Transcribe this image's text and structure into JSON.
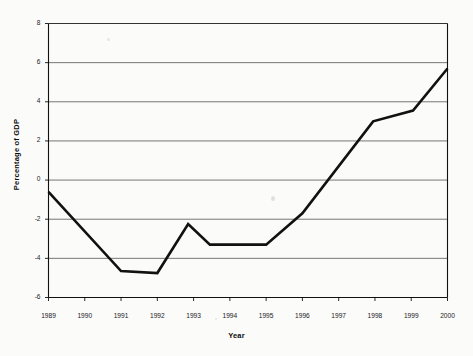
{
  "chart_data": {
    "type": "line",
    "title": "",
    "xlabel": "Year",
    "ylabel": "Percentage of GDP",
    "xlim": [
      1989,
      2000
    ],
    "ylim": [
      -6,
      8
    ],
    "grid": "horizontal",
    "legend": "none",
    "x_ticks": [
      "1989",
      "1990",
      "1991",
      "1992",
      "1993",
      "1994",
      "1995",
      "1996",
      "1997",
      "1998",
      "1999",
      "2000"
    ],
    "y_ticks": [
      "8",
      "6",
      "4",
      "2",
      "0",
      "-2",
      "-4",
      "-6"
    ],
    "series": [
      {
        "name": "Percentage of GDP",
        "color": "#111111",
        "x": [
          1989,
          1991,
          1992,
          1992.85,
          1993.45,
          1994,
          1995,
          1996,
          1997.95,
          1999.05,
          2000
        ],
        "values": [
          -0.6,
          -4.65,
          -4.75,
          -2.25,
          -3.3,
          -3.3,
          -3.3,
          -1.7,
          3.0,
          3.55,
          5.7
        ]
      }
    ]
  },
  "axes": {
    "y_title": "Percentage of GDP",
    "x_title": "Year"
  }
}
